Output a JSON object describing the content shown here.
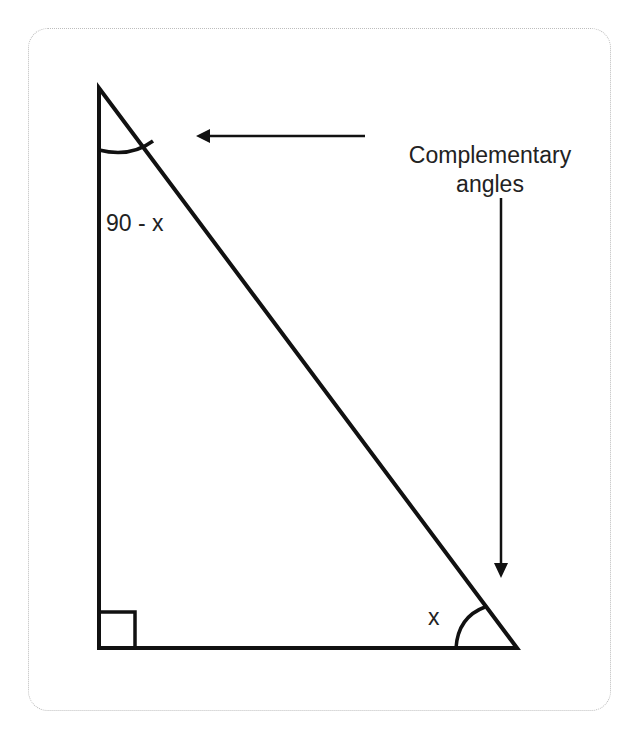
{
  "diagram": {
    "annotation": {
      "line1": "Complementary",
      "line2": "angles"
    },
    "angle_labels": {
      "top": "90 - x",
      "bottom_right": "x"
    },
    "colors": {
      "stroke": "#111111",
      "text": "#222222",
      "card_border": "#bdbdbd",
      "background": "#ffffff"
    },
    "shapes": {
      "triangle": {
        "vertices": [
          [
            99,
            88
          ],
          [
            99,
            648
          ],
          [
            517,
            648
          ]
        ]
      },
      "right_angle_marker": {
        "x": 99,
        "y": 612,
        "size": 36
      },
      "arrow_horizontal": {
        "from": [
          365,
          136
        ],
        "to": [
          196,
          136
        ]
      },
      "arrow_vertical": {
        "from": [
          501,
          198
        ],
        "to": [
          501,
          578
        ]
      }
    }
  }
}
